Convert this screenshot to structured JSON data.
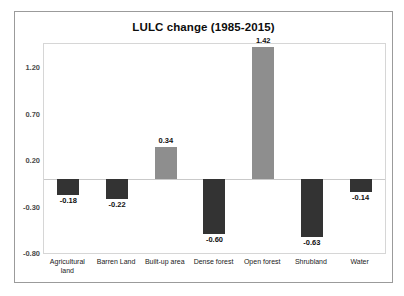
{
  "chart_data": {
    "type": "bar",
    "title": "LULC change (1985-2015)",
    "xlabel": "",
    "ylabel": "",
    "categories": [
      "Agricultural land",
      "Barren Land",
      "Built-up area",
      "Dense forest",
      "Open forest",
      "Shrubland",
      "Water"
    ],
    "values": [
      -0.18,
      -0.22,
      0.34,
      -0.6,
      1.42,
      -0.63,
      -0.14
    ],
    "data_labels": [
      "-0.18",
      "-0.22",
      "0.34",
      "-0.60",
      "1.42",
      "-0.63",
      "-0.14"
    ],
    "ylim": [
      -0.8,
      1.45
    ],
    "yticks": [
      1.2,
      0.7,
      0.2,
      -0.3,
      -0.8
    ],
    "ytick_labels": [
      "1.20",
      "0.70",
      "0.20",
      "-0.30",
      "-0.80"
    ],
    "grid": false,
    "legend": null,
    "colors": {
      "positive_bar": "#8e8e8e",
      "negative_bar": "#333333",
      "zero_line": "#c9c9c9",
      "plot_border": "#d6d6d6",
      "frame_border": "#9b9b9b",
      "title_text": "#0d0d0d",
      "tick_text": "#4a4a4a",
      "background": "#ffffff"
    }
  }
}
